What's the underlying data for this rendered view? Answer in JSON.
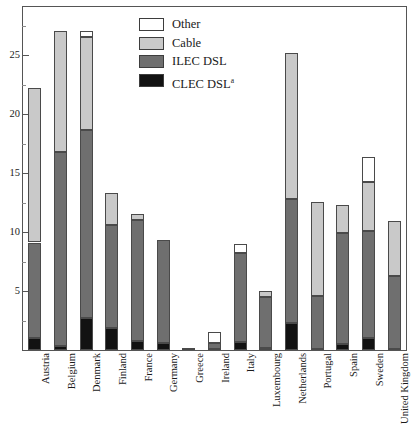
{
  "caption_sliver": "",
  "legend": {
    "position": "top-center-inside",
    "items": [
      {
        "label": "Other",
        "key": "other",
        "color": "#ffffff"
      },
      {
        "label": "Cable",
        "key": "cable",
        "color": "#c9c9c9"
      },
      {
        "label": "ILEC DSL",
        "key": "ilec",
        "color": "#6f6f6f"
      },
      {
        "label": "CLEC DSL",
        "key": "clec",
        "color": "#121212",
        "superscript": "a"
      }
    ]
  },
  "y_axis": {
    "ticks_major": [
      5,
      10,
      15,
      20,
      25
    ],
    "ticks_minor": [
      2.5,
      7.5,
      12.5,
      17.5,
      22.5,
      27.5
    ],
    "min": 0,
    "max": 29.2,
    "grid": false
  },
  "chart_data": {
    "type": "bar",
    "title": "",
    "subtitle": "",
    "xlabel": "",
    "ylabel": "",
    "ylim": [
      0,
      29.2
    ],
    "stacked": true,
    "grid": false,
    "legend_position": "top-center-inside",
    "categories": [
      "Austria",
      "Belgium",
      "Denmark",
      "Finland",
      "France",
      "Germany",
      "Greece",
      "Ireland",
      "Italy",
      "Luxembourg",
      "Netherlands",
      "Portugal",
      "Spain",
      "Sweden",
      "United Kingdom"
    ],
    "series": [
      {
        "name": "CLEC DSL",
        "color": "#121212",
        "values": [
          1.0,
          0.3,
          2.7,
          1.9,
          0.8,
          0.6,
          0.0,
          0.1,
          0.7,
          0.2,
          2.3,
          0.1,
          0.5,
          1.0,
          0.1
        ]
      },
      {
        "name": "ILEC DSL",
        "color": "#6f6f6f",
        "values": [
          8.1,
          16.5,
          15.9,
          8.7,
          10.2,
          8.7,
          0.15,
          0.5,
          7.5,
          4.3,
          10.5,
          4.5,
          9.4,
          9.1,
          6.2
        ]
      },
      {
        "name": "Cable",
        "color": "#c9c9c9",
        "values": [
          13.1,
          10.2,
          7.9,
          2.7,
          0.5,
          0.0,
          0.0,
          0.0,
          0.0,
          0.5,
          12.3,
          7.9,
          2.4,
          4.1,
          4.6
        ]
      },
      {
        "name": "Other",
        "color": "#ffffff",
        "values": [
          0.0,
          0.0,
          0.5,
          0.0,
          0.0,
          0.0,
          0.0,
          0.9,
          0.8,
          0.0,
          0.0,
          0.0,
          0.0,
          2.1,
          0.0
        ]
      }
    ],
    "totals": [
      22.2,
      27.0,
      27.0,
      13.3,
      11.5,
      9.3,
      0.15,
      1.5,
      9.0,
      5.0,
      25.1,
      12.5,
      12.3,
      16.3,
      10.9
    ]
  }
}
